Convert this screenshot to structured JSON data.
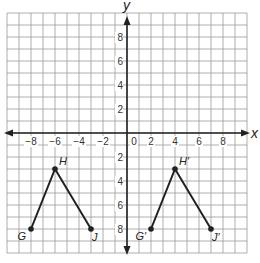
{
  "diagram": {
    "type": "coordinate-plane",
    "x_axis_label": "x",
    "y_axis_label": "y",
    "range": {
      "xmin": -10,
      "xmax": 10,
      "ymin": -10,
      "ymax": 10
    },
    "x_ticks": [
      -8,
      -6,
      -4,
      -2,
      2,
      4,
      6,
      8
    ],
    "y_ticks": [
      8,
      6,
      4,
      2,
      -2,
      -4,
      -6,
      -8
    ],
    "origin_label": "0",
    "line_color": "#222222",
    "grid_color": "#9a9a9a"
  },
  "figures": [
    {
      "name": "original",
      "points": [
        {
          "label": "G",
          "x": -8,
          "y": -8
        },
        {
          "label": "H",
          "x": -6,
          "y": -3
        },
        {
          "label": "J",
          "x": -3,
          "y": -8
        }
      ]
    },
    {
      "name": "image",
      "points": [
        {
          "label": "G′",
          "x": 2,
          "y": -8
        },
        {
          "label": "H′",
          "x": 4,
          "y": -3
        },
        {
          "label": "J′",
          "x": 7,
          "y": -8
        }
      ]
    }
  ]
}
